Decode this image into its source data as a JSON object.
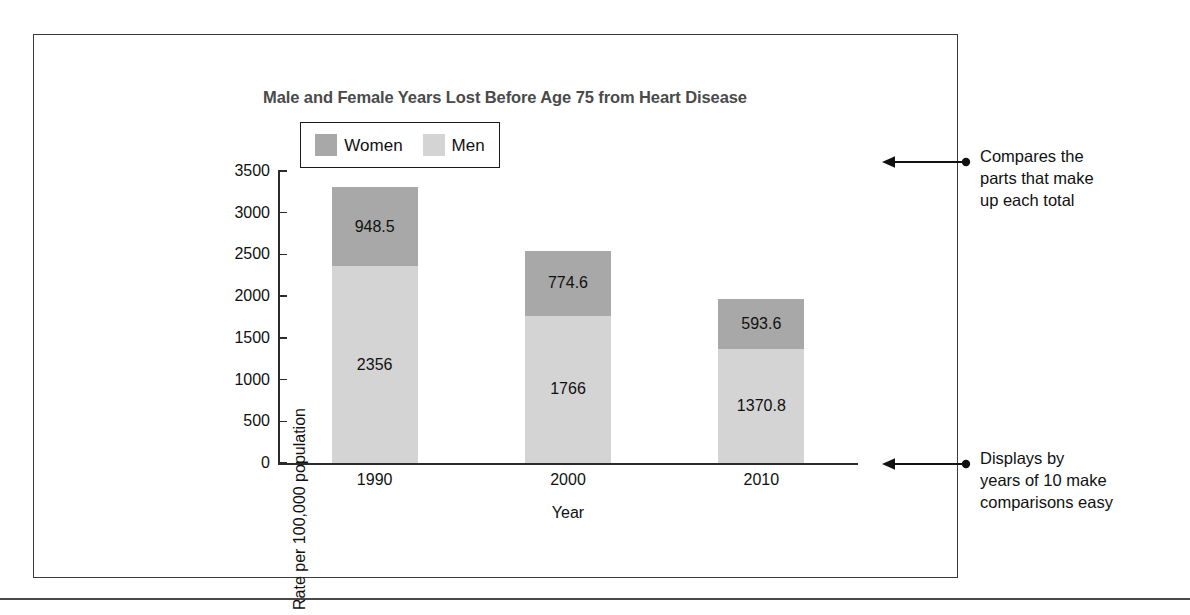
{
  "chart_data": {
    "type": "bar",
    "subtype": "stacked-bar",
    "title": "Male and Female Years Lost Before Age 75 from Heart Disease",
    "xlabel": "Year",
    "ylabel": "Rate per 100,000 population",
    "categories": [
      "1990",
      "2000",
      "2010"
    ],
    "series": [
      {
        "name": "Men",
        "values": [
          2356,
          1766,
          1370.8
        ],
        "color": "#d4d4d4",
        "value_labels": [
          "2356",
          "1766",
          "1370.8"
        ]
      },
      {
        "name": "Women",
        "values": [
          948.5,
          774.6,
          593.6
        ],
        "color": "#a8a8a8",
        "value_labels": [
          "948.5",
          "774.6",
          "593.6"
        ]
      }
    ],
    "stack_order": [
      "Men",
      "Women"
    ],
    "totals": [
      3304.5,
      2540.6,
      1964.4
    ],
    "ylim": [
      0,
      3500
    ],
    "ytick_labels": [
      "0",
      "500",
      "1000",
      "1500",
      "2000",
      "2500",
      "3000",
      "3500"
    ],
    "ytick_values": [
      0,
      500,
      1000,
      1500,
      2000,
      2500,
      3000,
      3500
    ],
    "grid": false,
    "legend_position": "top-left-inside"
  },
  "legend": {
    "entries": [
      {
        "label": "Women",
        "color": "#a8a8a8"
      },
      {
        "label": "Men",
        "color": "#d4d4d4"
      }
    ]
  },
  "annotations": [
    {
      "id": "annotation-top",
      "lines": [
        "Compares the",
        "parts that make",
        "up each total"
      ],
      "arrow_direction": "left"
    },
    {
      "id": "annotation-bottom",
      "lines": [
        "Displays by",
        "years of 10 make",
        "comparisons easy"
      ],
      "arrow_direction": "left"
    }
  ],
  "colors": {
    "women": "#a8a8a8",
    "men": "#d4d4d4",
    "axis": "#2b2b2b",
    "frame": "#3a3a3a",
    "title": "#4a4a4a",
    "text": "#111111"
  }
}
